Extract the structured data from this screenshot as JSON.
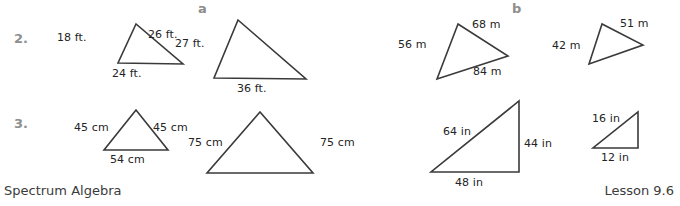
{
  "worksheet": {
    "columns": [
      {
        "label": "a"
      },
      {
        "label": "b"
      }
    ],
    "problems": [
      {
        "number": "2."
      },
      {
        "number": "3."
      }
    ]
  },
  "figures": {
    "p2a_small": {
      "name": "triangle-2a-small",
      "labels": {
        "left": "18 ft.",
        "right": "26 ft.",
        "base": "24 ft."
      }
    },
    "p2a_large": {
      "name": "triangle-2a-large",
      "labels": {
        "left": "27 ft.",
        "base": "36 ft."
      }
    },
    "p2b_large": {
      "name": "triangle-2b-large",
      "labels": {
        "left": "56 m",
        "top": "68 m",
        "base": "84 m"
      }
    },
    "p2b_small": {
      "name": "triangle-2b-small",
      "labels": {
        "left": "42 m",
        "top": "51 m"
      }
    },
    "p3a_small": {
      "name": "triangle-3a-small",
      "labels": {
        "left": "45 cm",
        "right": "45 cm",
        "base": "54 cm"
      }
    },
    "p3a_large": {
      "name": "triangle-3a-large",
      "labels": {
        "left": "75 cm",
        "right": "75 cm"
      }
    },
    "p3b_large": {
      "name": "triangle-3b-large",
      "labels": {
        "hyp": "64 in",
        "right": "44 in",
        "base": "48 in"
      }
    },
    "p3b_small": {
      "name": "triangle-3b-small",
      "labels": {
        "hyp": "16 in",
        "base": "12 in"
      }
    }
  },
  "footer": {
    "left": "Spectrum Algebra",
    "right": "Lesson 9.6"
  },
  "colors": {
    "ink": "#3a3a3a",
    "muted": "#8d8d8d",
    "paper": "#ffffff"
  }
}
